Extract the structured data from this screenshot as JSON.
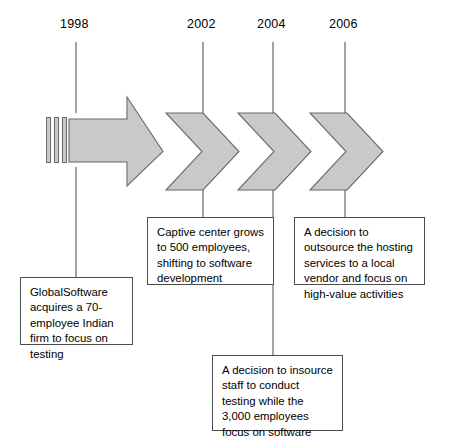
{
  "diagram": {
    "type": "process-timeline",
    "title": "",
    "arrow_fill": "#c9c9c9",
    "arrow_stroke": "#6b6b6b",
    "line_color": "#555555",
    "box_border": "#4d4d4d",
    "background": "#ffffff",
    "years": [
      {
        "id": "year-1998",
        "label": "1998",
        "x": 76,
        "label_x": 60,
        "label_y": 24
      },
      {
        "id": "year-2002",
        "label": "2002",
        "x": 203,
        "label_x": 187,
        "label_y": 24
      },
      {
        "id": "year-2004",
        "label": "2004",
        "x": 273,
        "label_x": 257,
        "label_y": 24
      },
      {
        "id": "year-2006",
        "label": "2006",
        "x": 345,
        "label_x": 329,
        "label_y": 24
      }
    ],
    "notes": [
      {
        "id": "note-1998",
        "year": "1998",
        "text": "GlobalSoftware acquires a 70-employee Indian firm to focus on testing",
        "x": 20,
        "y": 277,
        "width": 113,
        "height": 68
      },
      {
        "id": "note-2002",
        "year": "2002",
        "text": "Captive center grows to 500 employees, shifting to software development",
        "x": 147,
        "y": 217,
        "width": 127,
        "height": 68
      },
      {
        "id": "note-2004",
        "year": "2004",
        "text": "A decision to insource staff to conduct testing while the 3,000 employees focus on software development",
        "x": 212,
        "y": 355,
        "width": 131,
        "height": 76
      },
      {
        "id": "note-2006",
        "year": "2006",
        "text": "A decision to outsource the hosting services to a local vendor and focus on high-value activities",
        "x": 294,
        "y": 217,
        "width": 131,
        "height": 68
      }
    ],
    "arrow_segments": [
      {
        "id": "arrow-tail-bar-1",
        "shape": "bar"
      },
      {
        "id": "arrow-tail-bar-2",
        "shape": "bar"
      },
      {
        "id": "arrow-tail-bar-3",
        "shape": "bar"
      },
      {
        "id": "arrow-main-1998",
        "shape": "block-arrow"
      },
      {
        "id": "chevron-2002",
        "shape": "chevron"
      },
      {
        "id": "chevron-2004",
        "shape": "chevron"
      },
      {
        "id": "chevron-2006",
        "shape": "chevron"
      }
    ]
  }
}
